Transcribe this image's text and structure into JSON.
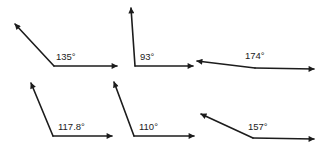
{
  "diagram": {
    "type": "angle-set",
    "line_color": "#1c1c1c",
    "angles": [
      {
        "label": "135°",
        "degrees": 135,
        "vertex": [
          54,
          66
        ],
        "ray1_tip": [
          15,
          24
        ],
        "ray2_tip": [
          117,
          66
        ],
        "label_pos": [
          56,
          60
        ]
      },
      {
        "label": "93°",
        "degrees": 93,
        "vertex": [
          135,
          66
        ],
        "ray1_tip": [
          131,
          8
        ],
        "ray2_tip": [
          193,
          66
        ],
        "label_pos": [
          140,
          60
        ]
      },
      {
        "label": "174°",
        "degrees": 174,
        "vertex": [
          255,
          68
        ],
        "ray1_tip": [
          197,
          61
        ],
        "ray2_tip": [
          314,
          69
        ],
        "label_pos": [
          245,
          59
        ]
      },
      {
        "label": "117.8°",
        "degrees": 117.8,
        "vertex": [
          53,
          136
        ],
        "ray1_tip": [
          31,
          83
        ],
        "ray2_tip": [
          112,
          136
        ],
        "label_pos": [
          58,
          130
        ]
      },
      {
        "label": "110°",
        "degrees": 110,
        "vertex": [
          134,
          136
        ],
        "ray1_tip": [
          114,
          82
        ],
        "ray2_tip": [
          194,
          136
        ],
        "label_pos": [
          139,
          130
        ]
      },
      {
        "label": "157°",
        "degrees": 157,
        "vertex": [
          253,
          138
        ],
        "ray1_tip": [
          201,
          114
        ],
        "ray2_tip": [
          314,
          139
        ],
        "label_pos": [
          248,
          130
        ]
      }
    ]
  }
}
